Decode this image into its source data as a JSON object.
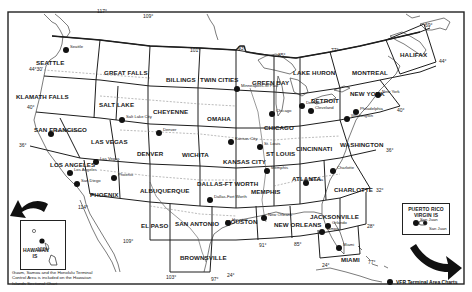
{
  "map": {
    "title": "VFR Terminal Area Charts index",
    "sectional_areas": [
      {
        "name": "SEATTLE",
        "x": 36,
        "y": 59
      },
      {
        "name": "GREAT FALLS",
        "x": 104,
        "y": 69
      },
      {
        "name": "BILLINGS",
        "x": 166,
        "y": 76
      },
      {
        "name": "TWIN CITIES",
        "x": 200,
        "y": 76
      },
      {
        "name": "GREEN BAY",
        "x": 252,
        "y": 79
      },
      {
        "name": "LAKE HURON",
        "x": 293,
        "y": 69
      },
      {
        "name": "MONTREAL",
        "x": 352,
        "y": 69
      },
      {
        "name": "HALIFAX",
        "x": 400,
        "y": 51
      },
      {
        "name": "KLAMATH FALLS",
        "x": 16,
        "y": 93
      },
      {
        "name": "SALT LAKE",
        "x": 99,
        "y": 101
      },
      {
        "name": "CHEYENNE",
        "x": 153,
        "y": 108
      },
      {
        "name": "OMAHA",
        "x": 207,
        "y": 115
      },
      {
        "name": "CHICAGO",
        "x": 264,
        "y": 124
      },
      {
        "name": "DETROIT",
        "x": 311,
        "y": 97
      },
      {
        "name": "NEW YORK",
        "x": 350,
        "y": 90
      },
      {
        "name": "SAN FRANCISCO",
        "x": 34,
        "y": 126
      },
      {
        "name": "LAS VEGAS",
        "x": 91,
        "y": 138
      },
      {
        "name": "DENVER",
        "x": 137,
        "y": 150
      },
      {
        "name": "WICHITA",
        "x": 182,
        "y": 151
      },
      {
        "name": "KANSAS CITY",
        "x": 223,
        "y": 158
      },
      {
        "name": "ST LOUIS",
        "x": 266,
        "y": 150
      },
      {
        "name": "CINCINNATI",
        "x": 296,
        "y": 145
      },
      {
        "name": "WASHINGTON",
        "x": 340,
        "y": 141
      },
      {
        "name": "LOS ANGELES",
        "x": 50,
        "y": 161
      },
      {
        "name": "PHOENIX",
        "x": 90,
        "y": 191
      },
      {
        "name": "ALBUQUERQUE",
        "x": 140,
        "y": 187
      },
      {
        "name": "DALLAS-FT WORTH",
        "x": 197,
        "y": 180
      },
      {
        "name": "MEMPHIS",
        "x": 251,
        "y": 188
      },
      {
        "name": "ATLANTA",
        "x": 292,
        "y": 175
      },
      {
        "name": "CHARLOTTE",
        "x": 334,
        "y": 186
      },
      {
        "name": "EL PASO",
        "x": 141,
        "y": 222
      },
      {
        "name": "SAN ANTONIO",
        "x": 175,
        "y": 220
      },
      {
        "name": "HOUSTON",
        "x": 226,
        "y": 218
      },
      {
        "name": "NEW ORLEANS",
        "x": 274,
        "y": 221
      },
      {
        "name": "JACKSONVILLE",
        "x": 310,
        "y": 213
      },
      {
        "name": "BROWNSVILLE",
        "x": 180,
        "y": 254
      },
      {
        "name": "MIAMI",
        "x": 341,
        "y": 256
      }
    ],
    "terminal_areas": [
      {
        "name": "Seattle",
        "x": 66,
        "y": 50
      },
      {
        "name": "Minneapolis-St Paul",
        "x": 237,
        "y": 89
      },
      {
        "name": "Salt Lake City",
        "x": 122,
        "y": 120
      },
      {
        "name": "Denver",
        "x": 159,
        "y": 133
      },
      {
        "name": "San Francisco",
        "x": 51,
        "y": 134
      },
      {
        "name": "Las Vegas",
        "x": 96,
        "y": 162
      },
      {
        "name": "Los Angeles",
        "x": 70,
        "y": 173
      },
      {
        "name": "San Diego",
        "x": 77,
        "y": 184
      },
      {
        "name": "Phoenix",
        "x": 114,
        "y": 178
      },
      {
        "name": "Kansas City",
        "x": 231,
        "y": 142
      },
      {
        "name": "St. Louis",
        "x": 260,
        "y": 147
      },
      {
        "name": "Chicago",
        "x": 272,
        "y": 114
      },
      {
        "name": "Detroit",
        "x": 302,
        "y": 106
      },
      {
        "name": "Cleveland",
        "x": 311,
        "y": 111
      },
      {
        "name": "New York",
        "x": 378,
        "y": 95
      },
      {
        "name": "Philadelphia",
        "x": 356,
        "y": 112
      },
      {
        "name": "Washington",
        "x": 347,
        "y": 119
      },
      {
        "name": "Dallas-Fort Worth",
        "x": 210,
        "y": 200
      },
      {
        "name": "Memphis",
        "x": 267,
        "y": 171
      },
      {
        "name": "Atlanta",
        "x": 306,
        "y": 183
      },
      {
        "name": "Charlotte",
        "x": 333,
        "y": 171
      },
      {
        "name": "Houston",
        "x": 228,
        "y": 223
      },
      {
        "name": "New Orleans",
        "x": 264,
        "y": 218
      },
      {
        "name": "Orlando",
        "x": 328,
        "y": 226
      },
      {
        "name": "Tampa",
        "x": 322,
        "y": 232
      },
      {
        "name": "Miami",
        "x": 339,
        "y": 248
      },
      {
        "name": "San Juan",
        "x": 416,
        "y": 223
      }
    ],
    "meridian_labels": [
      {
        "text": "117°",
        "x": 97,
        "y": 8
      },
      {
        "text": "109°",
        "x": 143,
        "y": 13
      },
      {
        "text": "101°",
        "x": 190,
        "y": 47
      },
      {
        "text": "93°",
        "x": 238,
        "y": 45
      },
      {
        "text": "85°",
        "x": 278,
        "y": 52
      },
      {
        "text": "77°",
        "x": 331,
        "y": 47
      },
      {
        "text": "69°",
        "x": 425,
        "y": 22
      },
      {
        "text": "122°",
        "x": 37,
        "y": 246
      },
      {
        "text": "114°",
        "x": 78,
        "y": 204
      },
      {
        "text": "109°",
        "x": 123,
        "y": 238
      },
      {
        "text": "103°",
        "x": 166,
        "y": 274
      },
      {
        "text": "97°",
        "x": 211,
        "y": 276
      },
      {
        "text": "91°",
        "x": 259,
        "y": 242
      },
      {
        "text": "85°",
        "x": 294,
        "y": 241
      },
      {
        "text": "77°",
        "x": 368,
        "y": 259
      }
    ],
    "parallel_labels": [
      {
        "text": "44°30'",
        "x": 29,
        "y": 66
      },
      {
        "text": "40°",
        "x": 27,
        "y": 104
      },
      {
        "text": "36°",
        "x": 19,
        "y": 142
      },
      {
        "text": "44°",
        "x": 439,
        "y": 58
      },
      {
        "text": "40°",
        "x": 397,
        "y": 107
      },
      {
        "text": "36°",
        "x": 386,
        "y": 147
      },
      {
        "text": "32°",
        "x": 376,
        "y": 187
      },
      {
        "text": "28°",
        "x": 367,
        "y": 223
      },
      {
        "text": "24°",
        "x": 227,
        "y": 272
      },
      {
        "text": "24°",
        "x": 322,
        "y": 262
      }
    ],
    "hawaii_inset": {
      "label": "HAWAIIAN IS",
      "note": "Guam, Samoa and the Honolulu Terminal Control Area is included on the Hawaiian Islands Sectional Chart"
    },
    "puerto_rico_inset": {
      "label": "PUERTO RICO VIRGIN IS",
      "city": "San Juan"
    },
    "legend": {
      "label": "VFR Terminal Area Charts",
      "symbol": "filled-circle"
    },
    "colors": {
      "ink": "#1a1a1a",
      "paper": "#ffffff",
      "grid": "#222222",
      "coast": "#555555"
    }
  }
}
